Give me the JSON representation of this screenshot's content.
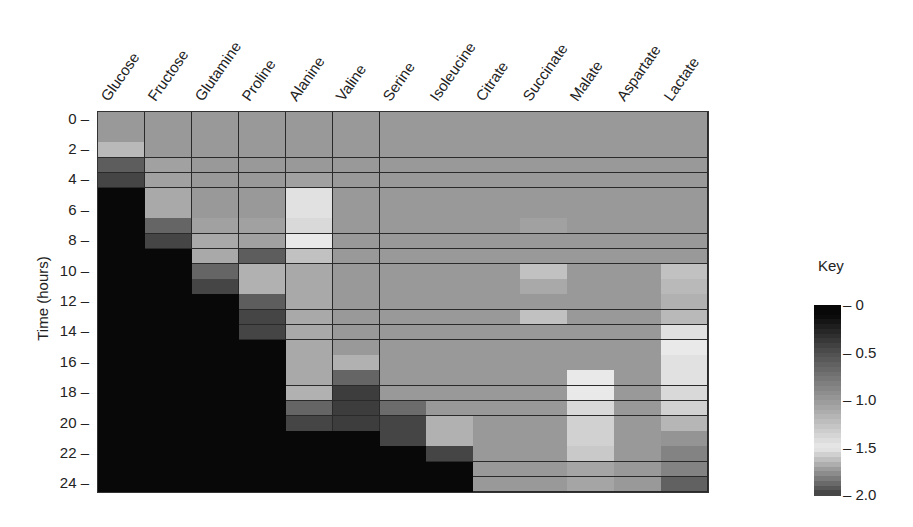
{
  "chart_data": {
    "type": "heatmap",
    "title": "",
    "xlabel": "",
    "ylabel": "Time (hours)",
    "columns": [
      "Glucose",
      "Fructose",
      "Glutamine",
      "Proline",
      "Alanine",
      "Valine",
      "Serine",
      "Isoleucine",
      "Citrate",
      "Succinate",
      "Malate",
      "Aspartate",
      "Lactate"
    ],
    "rows": [
      0,
      1,
      2,
      3,
      4,
      5,
      6,
      7,
      8,
      9,
      10,
      11,
      12,
      13,
      14,
      15,
      16,
      17,
      18,
      19,
      20,
      21,
      22,
      23,
      24
    ],
    "y_tick_labels": [
      "0",
      "2",
      "4",
      "6",
      "8",
      "10",
      "12",
      "14",
      "16",
      "18",
      "20",
      "22",
      "24"
    ],
    "colorbar": {
      "title": "Key",
      "ticks": [
        "0",
        "0.5",
        "1.0",
        "1.5",
        "2.0"
      ],
      "range": [
        0,
        2.0
      ]
    },
    "values": [
      [
        1.0,
        1.0,
        1.0,
        1.0,
        1.0,
        1.0,
        1.0,
        1.0,
        1.0,
        1.0,
        1.0,
        1.0,
        1.0
      ],
      [
        1.0,
        1.0,
        1.0,
        1.0,
        1.0,
        1.0,
        1.0,
        1.0,
        1.0,
        1.0,
        1.0,
        1.0,
        1.0
      ],
      [
        1.2,
        1.0,
        1.0,
        1.0,
        1.0,
        1.0,
        1.0,
        1.0,
        1.0,
        1.0,
        1.0,
        1.0,
        1.0
      ],
      [
        0.6,
        1.05,
        1.0,
        1.0,
        1.0,
        1.0,
        1.0,
        1.0,
        1.0,
        1.0,
        1.0,
        1.0,
        1.0
      ],
      [
        0.45,
        1.05,
        1.0,
        1.0,
        1.05,
        1.0,
        1.0,
        1.0,
        1.0,
        1.0,
        1.0,
        1.0,
        1.0
      ],
      [
        0.1,
        1.1,
        1.0,
        1.0,
        1.45,
        1.0,
        1.0,
        1.0,
        1.0,
        1.0,
        1.0,
        1.0,
        1.0
      ],
      [
        0.05,
        1.1,
        1.0,
        1.0,
        1.45,
        1.0,
        1.0,
        1.0,
        1.0,
        1.0,
        1.0,
        1.0,
        1.0
      ],
      [
        0.05,
        0.65,
        1.05,
        1.05,
        1.4,
        1.0,
        1.0,
        1.0,
        1.0,
        1.05,
        1.0,
        1.0,
        1.0
      ],
      [
        0.05,
        0.45,
        1.1,
        1.05,
        1.5,
        1.0,
        1.0,
        1.0,
        1.0,
        1.0,
        1.0,
        1.0,
        1.0
      ],
      [
        0.05,
        0.05,
        1.1,
        0.6,
        1.25,
        1.0,
        1.0,
        1.0,
        1.0,
        1.0,
        1.0,
        1.0,
        1.0
      ],
      [
        0.05,
        0.05,
        0.65,
        1.15,
        1.1,
        1.0,
        1.0,
        1.0,
        1.0,
        1.25,
        1.0,
        1.0,
        1.25
      ],
      [
        0.05,
        0.05,
        0.45,
        1.15,
        1.1,
        1.0,
        1.0,
        1.0,
        1.0,
        1.1,
        1.0,
        1.0,
        1.2
      ],
      [
        0.05,
        0.05,
        0.05,
        0.6,
        1.1,
        1.0,
        1.0,
        1.0,
        1.0,
        1.0,
        1.0,
        1.0,
        1.15
      ],
      [
        0.05,
        0.05,
        0.05,
        0.45,
        1.1,
        1.0,
        1.0,
        1.0,
        1.0,
        1.25,
        1.0,
        1.0,
        1.2
      ],
      [
        0.05,
        0.05,
        0.05,
        0.45,
        1.1,
        1.0,
        1.0,
        1.0,
        1.0,
        1.0,
        1.0,
        1.0,
        1.45
      ],
      [
        0.05,
        0.05,
        0.05,
        0.05,
        1.1,
        1.0,
        1.0,
        1.0,
        1.0,
        1.0,
        1.0,
        1.0,
        1.5
      ],
      [
        0.05,
        0.05,
        0.05,
        0.05,
        1.1,
        1.15,
        1.0,
        1.0,
        1.0,
        1.0,
        1.0,
        1.0,
        1.45
      ],
      [
        0.05,
        0.05,
        0.05,
        0.05,
        1.1,
        0.65,
        1.0,
        1.0,
        1.0,
        1.0,
        1.5,
        1.0,
        1.45
      ],
      [
        0.05,
        0.05,
        0.05,
        0.05,
        1.15,
        0.4,
        1.0,
        1.0,
        1.0,
        1.0,
        1.5,
        1.0,
        1.4
      ],
      [
        0.05,
        0.05,
        0.05,
        0.05,
        0.65,
        0.4,
        0.7,
        1.0,
        1.0,
        1.0,
        1.4,
        1.0,
        1.35
      ],
      [
        0.05,
        0.05,
        0.05,
        0.05,
        0.45,
        0.4,
        0.45,
        1.15,
        1.0,
        1.0,
        1.35,
        1.0,
        1.65
      ],
      [
        0.05,
        0.05,
        0.05,
        0.05,
        0.05,
        0.05,
        0.45,
        1.15,
        1.0,
        1.0,
        1.35,
        1.0,
        1.75
      ],
      [
        0.05,
        0.05,
        0.05,
        0.05,
        0.05,
        0.05,
        0.05,
        0.45,
        1.0,
        1.0,
        1.3,
        1.0,
        1.8
      ],
      [
        0.05,
        0.05,
        0.05,
        0.05,
        0.05,
        0.05,
        0.05,
        0.05,
        1.0,
        1.0,
        1.7,
        1.0,
        1.8
      ],
      [
        0.05,
        0.05,
        0.05,
        0.05,
        0.05,
        0.05,
        0.05,
        0.05,
        1.0,
        1.0,
        1.7,
        1.0,
        1.9
      ]
    ],
    "grid": true,
    "legend_position": "right"
  },
  "axis": {
    "ylabel": "Time (hours)",
    "key_title": "Key"
  },
  "colors": {
    "background": "#ffffff",
    "cell_border": "#2a2a2a",
    "text": "#222222"
  }
}
